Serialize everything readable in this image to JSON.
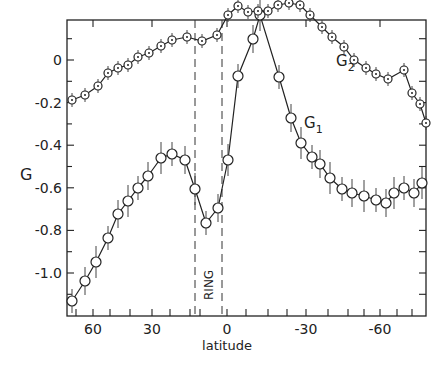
{
  "chart_data": {
    "type": "line",
    "title": "",
    "xlabel": "latitude",
    "ylabel": "G",
    "xlim": [
      71,
      -78
    ],
    "ylim": [
      -1.17,
      0.15
    ],
    "xticks": [
      60,
      30,
      0,
      -30,
      -60
    ],
    "yticks": [
      0,
      -0.2,
      -0.4,
      -0.6,
      -0.8,
      -1.0
    ],
    "ytick_labels": [
      "0",
      "-0.2",
      "-0.4",
      "-0.6",
      "-0.8",
      "-1.0"
    ],
    "grid": false,
    "annotations": [
      {
        "text": "RING",
        "x": -9,
        "rotated": true
      },
      {
        "text": "G₂",
        "near_series": "G2"
      },
      {
        "text": "G₁",
        "near_series": "G1"
      }
    ],
    "ring_bounds": [
      -14,
      -2
    ],
    "series": [
      {
        "name": "G2",
        "marker": "dotted-circle",
        "x": [
          67,
          60,
          54,
          47,
          42,
          37,
          31,
          25,
          20,
          14,
          8,
          4,
          0,
          -4,
          -8,
          -12,
          -16,
          -21,
          -26,
          -30,
          -35,
          -40,
          -46,
          -51,
          -56,
          -60,
          -64,
          -69,
          -74
        ],
        "y": [
          -0.72,
          -0.64,
          -0.54,
          -0.44,
          -0.38,
          -0.34,
          -0.3,
          -0.26,
          -0.22,
          -0.18,
          -0.14,
          -0.12,
          -0.13,
          -0.16,
          -0.12,
          -0.02,
          0.04,
          0.02,
          0.02,
          0.02,
          0.06,
          0.08,
          0.07,
          0.02,
          -0.08,
          -0.14,
          -0.2,
          -0.25,
          -0.33
        ]
      },
      {
        "name": "G1",
        "marker": "open-circle",
        "x": [
          67,
          60,
          54,
          47,
          42,
          37,
          31,
          25,
          20,
          14,
          8,
          4,
          0,
          -4
        ],
        "y": [
          -1.13,
          -1.03,
          -0.92,
          -0.79,
          -0.68,
          -0.61,
          -0.55,
          -0.47,
          -0.41,
          -0.38,
          -0.43,
          -0.61,
          -0.77,
          -0.72
        ]
      }
    ]
  },
  "points": {
    "G2": [
      [
        72,
        100
      ],
      [
        85,
        95
      ],
      [
        98,
        86
      ],
      [
        108,
        73
      ],
      [
        118,
        68
      ],
      [
        128,
        65
      ],
      [
        138,
        57
      ],
      [
        149,
        53
      ],
      [
        161,
        46
      ],
      [
        172,
        40
      ],
      [
        187,
        37
      ],
      [
        202,
        41
      ],
      [
        217,
        35
      ],
      [
        228,
        15
      ],
      [
        238,
        6
      ],
      [
        248,
        12
      ],
      [
        258,
        11
      ],
      [
        268,
        11
      ],
      [
        278,
        5
      ],
      [
        289,
        3
      ],
      [
        300,
        5
      ],
      [
        310,
        15
      ],
      [
        322,
        27
      ],
      [
        332,
        37
      ],
      [
        344,
        47
      ],
      [
        354,
        60
      ],
      [
        366,
        68
      ],
      [
        376,
        74
      ],
      [
        388,
        79
      ],
      [
        404,
        70
      ],
      [
        412,
        93
      ],
      [
        420,
        104
      ],
      [
        426,
        123
      ]
    ],
    "G1": [
      [
        72,
        301
      ],
      [
        85,
        281
      ],
      [
        96,
        262
      ],
      [
        108,
        238
      ],
      [
        118,
        214
      ],
      [
        128,
        201
      ],
      [
        138,
        188
      ],
      [
        148,
        176
      ],
      [
        161,
        158
      ],
      [
        172,
        154
      ],
      [
        185,
        160
      ],
      [
        195,
        189
      ],
      [
        206,
        223
      ],
      [
        218,
        208
      ],
      [
        228,
        160
      ],
      [
        238,
        76
      ],
      [
        253,
        39
      ],
      [
        260,
        15
      ],
      [
        279,
        77
      ],
      [
        291,
        118
      ],
      [
        301,
        143
      ],
      [
        312,
        157
      ],
      [
        320,
        164
      ],
      [
        330,
        178
      ],
      [
        342,
        189
      ],
      [
        352,
        193
      ],
      [
        364,
        196
      ],
      [
        376,
        200
      ],
      [
        386,
        203
      ],
      [
        394,
        193
      ],
      [
        404,
        188
      ],
      [
        414,
        193
      ],
      [
        422,
        183
      ]
    ]
  },
  "labels": {
    "y_axis_title": "G",
    "x_axis_title": "latitude",
    "ring": "RING",
    "g2_prefix": "G",
    "g2_sub": "2",
    "g1_prefix": "G",
    "g1_sub": "1"
  }
}
